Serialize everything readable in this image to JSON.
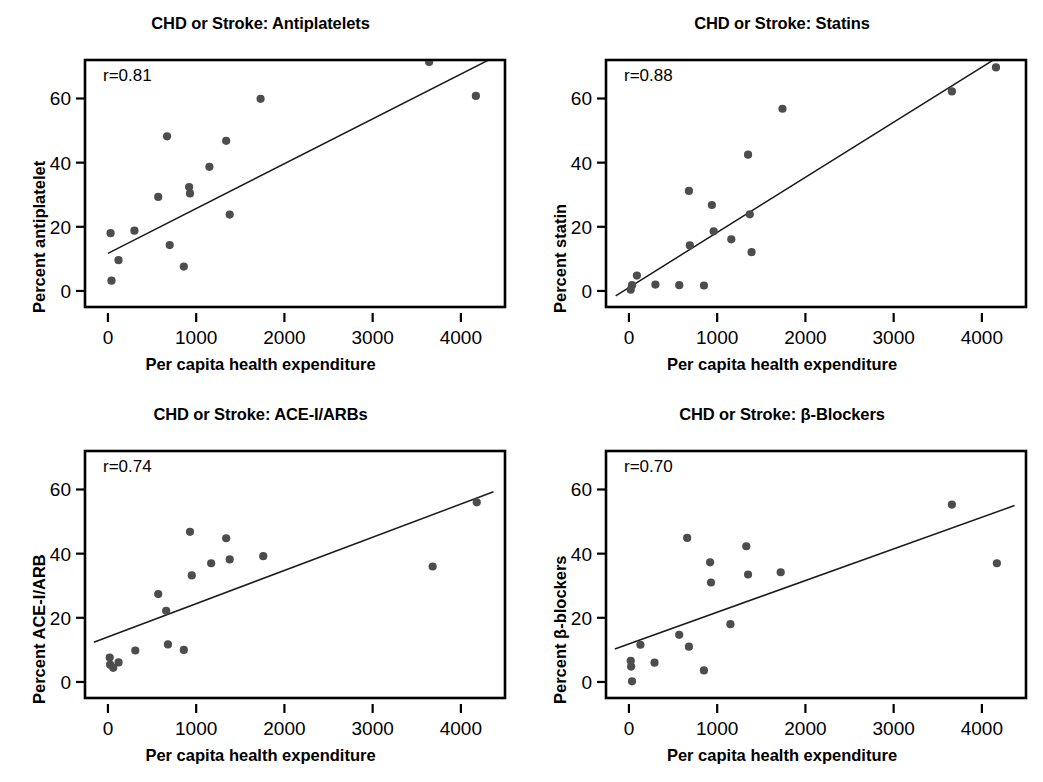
{
  "figure": {
    "shared_xlabel": "Per capita health expenditure",
    "xticks": [
      0,
      1000,
      2000,
      3000,
      4000
    ],
    "yticks": [
      0,
      20,
      40,
      60
    ],
    "xlim": [
      -260,
      4500
    ],
    "ylim": [
      -5,
      72
    ]
  },
  "chart_data": [
    {
      "type": "scatter",
      "panel_id": "antiplatelets",
      "title": "CHD or Stroke: Antiplatelets",
      "xlabel": "Per capita health expenditure",
      "ylabel": "Percent antiplatelet",
      "annotation": "r=0.81",
      "r": 0.81,
      "xlim": [
        -260,
        4500
      ],
      "ylim": [
        -5,
        72
      ],
      "xticks": [
        0,
        1000,
        2000,
        3000,
        4000
      ],
      "yticks": [
        0,
        20,
        40,
        60
      ],
      "grid": false,
      "legend": "none",
      "fit_line": {
        "x0": 0,
        "y0": 11.7,
        "x1": 4350,
        "y1": 72.5
      },
      "points": [
        {
          "x": 30,
          "y": 18.0
        },
        {
          "x": 40,
          "y": 3.2
        },
        {
          "x": 120,
          "y": 9.6
        },
        {
          "x": 300,
          "y": 18.8
        },
        {
          "x": 570,
          "y": 29.3
        },
        {
          "x": 670,
          "y": 48.2
        },
        {
          "x": 700,
          "y": 14.3
        },
        {
          "x": 860,
          "y": 7.6
        },
        {
          "x": 920,
          "y": 32.4
        },
        {
          "x": 930,
          "y": 30.4
        },
        {
          "x": 1150,
          "y": 38.7
        },
        {
          "x": 1340,
          "y": 46.8
        },
        {
          "x": 1380,
          "y": 23.8
        },
        {
          "x": 1730,
          "y": 59.9
        },
        {
          "x": 3640,
          "y": 71.4
        },
        {
          "x": 4170,
          "y": 60.8
        }
      ]
    },
    {
      "type": "scatter",
      "panel_id": "statins",
      "title": "CHD or Stroke: Statins",
      "xlabel": "Per capita health expenditure",
      "ylabel": "Percent statin",
      "annotation": "r=0.88",
      "r": 0.88,
      "xlim": [
        -260,
        4500
      ],
      "ylim": [
        -5,
        72
      ],
      "xticks": [
        0,
        1000,
        2000,
        3000,
        4000
      ],
      "yticks": [
        0,
        20,
        40,
        60
      ],
      "grid": false,
      "legend": "none",
      "fit_line": {
        "x0": -150,
        "y0": -1.5,
        "x1": 4130,
        "y1": 72.0
      },
      "points": [
        {
          "x": 20,
          "y": 0.4
        },
        {
          "x": 35,
          "y": 1.8
        },
        {
          "x": 90,
          "y": 4.8
        },
        {
          "x": 300,
          "y": 2.0
        },
        {
          "x": 570,
          "y": 1.8
        },
        {
          "x": 680,
          "y": 31.2
        },
        {
          "x": 690,
          "y": 14.2
        },
        {
          "x": 850,
          "y": 1.7
        },
        {
          "x": 940,
          "y": 26.8
        },
        {
          "x": 960,
          "y": 18.6
        },
        {
          "x": 1160,
          "y": 16.1
        },
        {
          "x": 1350,
          "y": 42.5
        },
        {
          "x": 1370,
          "y": 23.9
        },
        {
          "x": 1390,
          "y": 12.1
        },
        {
          "x": 1740,
          "y": 56.8
        },
        {
          "x": 3660,
          "y": 62.2
        },
        {
          "x": 4160,
          "y": 69.7
        }
      ]
    },
    {
      "type": "scatter",
      "panel_id": "ace-i-arbs",
      "title": "CHD or Stroke: ACE-I/ARBs",
      "xlabel": "Per capita health expenditure",
      "ylabel": "Percent ACE-I/ARB",
      "annotation": "r=0.74",
      "r": 0.74,
      "xlim": [
        -260,
        4500
      ],
      "ylim": [
        -5,
        72
      ],
      "xticks": [
        0,
        1000,
        2000,
        3000,
        4000
      ],
      "yticks": [
        0,
        20,
        40,
        60
      ],
      "grid": false,
      "legend": "none",
      "fit_line": {
        "x0": -160,
        "y0": 12.4,
        "x1": 4370,
        "y1": 59.3
      },
      "points": [
        {
          "x": 20,
          "y": 7.6
        },
        {
          "x": 25,
          "y": 5.4
        },
        {
          "x": 60,
          "y": 4.4
        },
        {
          "x": 120,
          "y": 6.1
        },
        {
          "x": 310,
          "y": 9.8
        },
        {
          "x": 570,
          "y": 27.4
        },
        {
          "x": 660,
          "y": 22.2
        },
        {
          "x": 680,
          "y": 11.7
        },
        {
          "x": 860,
          "y": 10.0
        },
        {
          "x": 930,
          "y": 46.8
        },
        {
          "x": 950,
          "y": 33.2
        },
        {
          "x": 1170,
          "y": 37.0
        },
        {
          "x": 1340,
          "y": 44.8
        },
        {
          "x": 1380,
          "y": 38.2
        },
        {
          "x": 1760,
          "y": 39.2
        },
        {
          "x": 3680,
          "y": 36.0
        },
        {
          "x": 4180,
          "y": 56.0
        }
      ]
    },
    {
      "type": "scatter",
      "panel_id": "beta-blockers",
      "title": "CHD or Stroke: β-Blockers",
      "xlabel": "Per capita health expenditure",
      "ylabel": "Percent β-blockers",
      "annotation": "r=0.70",
      "r": 0.7,
      "xlim": [
        -260,
        4500
      ],
      "ylim": [
        -5,
        72
      ],
      "xticks": [
        0,
        1000,
        2000,
        3000,
        4000
      ],
      "yticks": [
        0,
        20,
        40,
        60
      ],
      "grid": false,
      "legend": "none",
      "fit_line": {
        "x0": -160,
        "y0": 10.3,
        "x1": 4370,
        "y1": 55.0
      },
      "points": [
        {
          "x": 20,
          "y": 6.6
        },
        {
          "x": 25,
          "y": 4.8
        },
        {
          "x": 35,
          "y": 0.2
        },
        {
          "x": 130,
          "y": 11.6
        },
        {
          "x": 290,
          "y": 6.0
        },
        {
          "x": 570,
          "y": 14.7
        },
        {
          "x": 660,
          "y": 44.9
        },
        {
          "x": 680,
          "y": 11.0
        },
        {
          "x": 850,
          "y": 3.6
        },
        {
          "x": 920,
          "y": 37.3
        },
        {
          "x": 930,
          "y": 31.0
        },
        {
          "x": 1150,
          "y": 18.0
        },
        {
          "x": 1330,
          "y": 42.3
        },
        {
          "x": 1350,
          "y": 33.5
        },
        {
          "x": 1720,
          "y": 34.2
        },
        {
          "x": 3660,
          "y": 55.3
        },
        {
          "x": 4170,
          "y": 37.0
        }
      ]
    }
  ]
}
